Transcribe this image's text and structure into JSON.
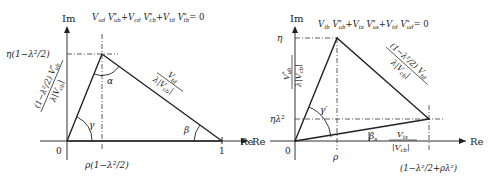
{
  "left_diagram": {
    "axis_im": "Im",
    "axis_re": "Re",
    "equation": "V_ud V*_ub + V_cd V*_cb + V_td V*_tb = 0",
    "eq_parts": [
      "V",
      "ud",
      "V",
      "*",
      "ub",
      "+ V",
      "cd",
      "V",
      "*",
      "cb",
      "+ V",
      "td",
      "V",
      "*",
      "tb",
      "= 0"
    ],
    "y_tick": "η(1−λ²/2)",
    "x_tick": "ρ(1−λ²/2)",
    "origin": "0",
    "one": "1",
    "side_left_num": "(1−λ²/2) V*ub",
    "side_left_den": "λ|V_cb|",
    "side_right_num": "V_td",
    "side_right_den": "λ|V_cb|",
    "angle_alpha": "α",
    "angle_beta": "β",
    "angle_gamma": "γ"
  },
  "right_diagram": {
    "axis_im": "Im",
    "axis_re": "Re",
    "axis_re_left": "Re",
    "equation": "V_tb V*_ub + V_ts V*_us + V_td V*_ud = 0",
    "y_tick_top": "η",
    "y_tick_low": "ηλ²",
    "x_tick": "ρ",
    "x_tick_right": "(1−λ²/2+ρλ²)",
    "origin": "0",
    "side_left_num": "V*ub",
    "side_left_den": "λ|V_cb|",
    "side_right_num": "(1−λ²/2) V_td",
    "side_right_den": "λ|V_cb|",
    "side_bottom_num": "V_ts",
    "side_bottom_den": "|V_cb|",
    "angle_gamma_prime": "γ′",
    "angle_beta_s": "β_s"
  }
}
